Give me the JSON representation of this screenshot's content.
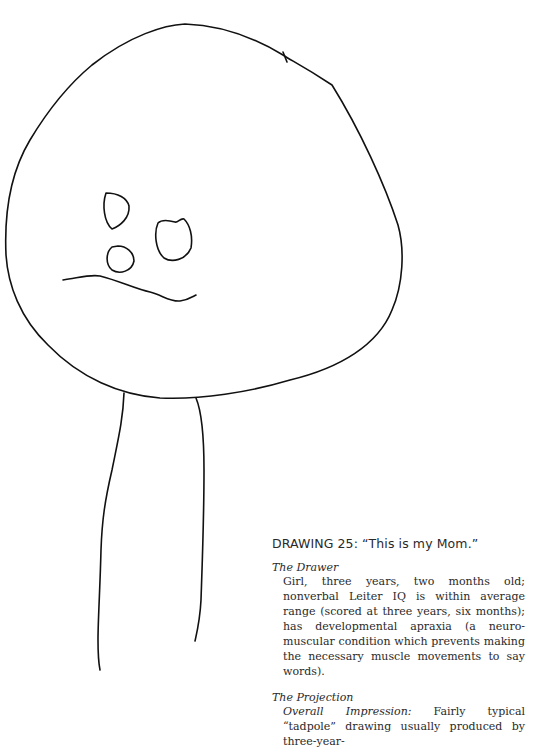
{
  "figure": {
    "label": "DRAWING 25",
    "quote": "“This is my Mom.”",
    "title_full": "DRAWING 25:  “This is my Mom.”"
  },
  "sections": [
    {
      "heading": "The Drawer",
      "text": "Girl, three years, two months old; nonverbal Leiter IQ is within average range (scored at three years, six months); has developmental apraxia (a neuro-muscular condition which prevents making the necessary muscle movements to say words)."
    },
    {
      "heading": "The Projection",
      "lead": "Overall Impression:",
      "text": " Fairly typical “tadpole” drawing usually produced by three-year-"
    }
  ]
}
